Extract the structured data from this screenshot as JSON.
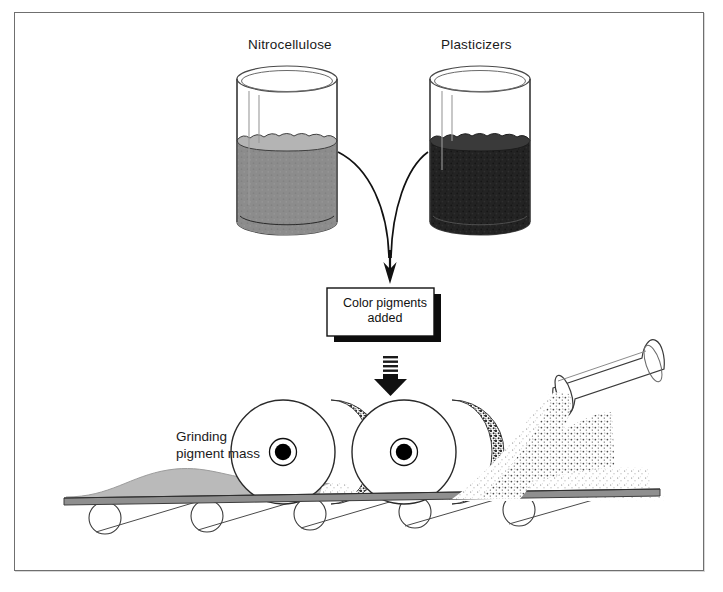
{
  "diagram": {
    "frame_color": "#6f6f6f",
    "background": "#ffffff"
  },
  "labels": {
    "left_beaker": "Nitrocellulose",
    "right_beaker": "Plasticizers",
    "grinding_line1": "Grinding",
    "grinding_line2": "pigment mass"
  },
  "process_box": {
    "line1": "Color pigments",
    "line2": "added",
    "fill": "#ffffff",
    "border": "#111111",
    "shadow": "#0d0d0d"
  },
  "beakers": {
    "left": {
      "name": "nitrocellulose-beaker",
      "liquid_color": "#8c8c8c",
      "surface_color": "#b4b4b4",
      "glass_color": "#4a4a4a"
    },
    "right": {
      "name": "plasticizers-beaker",
      "liquid_color": "#232323",
      "surface_color": "#3a3a3a",
      "glass_color": "#4a4a4a"
    }
  },
  "machine": {
    "roller_count": 2,
    "roller_fill": "#ffffff",
    "roller_stroke": "#2a2a2a",
    "hub_color": "#000000",
    "crescent_stipple": "#2b2b2b",
    "belt_color": "#8f8f8f",
    "belt_stroke": "#3c3c3c",
    "support_roller_count": 5,
    "pigment_mound_color": "#b6b6b6",
    "chute_fill": "#ffffff",
    "chute_stroke": "#3a3a3a",
    "powder_color": "#6a6a6a"
  },
  "arrows": {
    "left_curve": "curved-arrow-from-nitrocellulose",
    "right_curve": "curved-arrow-from-plasticizers",
    "thick_down": "thick-striped-down-arrow",
    "thin_down": "thin-down-arrow-to-box"
  }
}
